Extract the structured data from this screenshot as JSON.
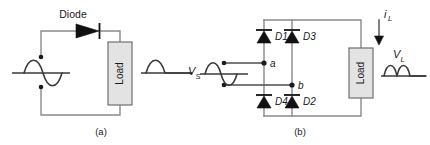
{
  "figure": {
    "background": "#ffffff",
    "wire_color": "#8a8a8a",
    "diode_color": "#111111",
    "load_fill": "#e3e3e3",
    "wave_color": "#3a3a3a"
  },
  "circuit_a": {
    "caption": "(a)",
    "diode_label": "Diode",
    "load_label": "Load",
    "input_waveform": {
      "name": "sine-wave",
      "description": "full sine wave, one positive half and one negative half"
    },
    "output_waveform": {
      "name": "half-wave-rectified",
      "description": "single positive hump followed by flat line"
    }
  },
  "circuit_b": {
    "caption": "(b)",
    "source_label": "V",
    "source_sub": "S",
    "load_label": "Load",
    "current_label": "i",
    "current_sub": "L",
    "output_label": "V",
    "output_sub": "L",
    "nodes": [
      {
        "name": "node-a",
        "label": "a"
      },
      {
        "name": "node-b",
        "label": "b"
      }
    ],
    "diodes": [
      {
        "name": "diode-d1",
        "label": "D1"
      },
      {
        "name": "diode-d3",
        "label": "D3"
      },
      {
        "name": "diode-d4",
        "label": "D4"
      },
      {
        "name": "diode-d2",
        "label": "D2"
      }
    ],
    "input_waveform": {
      "name": "sine-wave",
      "description": "full sine wave, one positive half and one negative half"
    },
    "output_waveform": {
      "name": "full-wave-rectified",
      "description": "two positive humps"
    }
  }
}
